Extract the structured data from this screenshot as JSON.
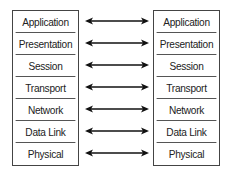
{
  "diagram": {
    "left_stack": {
      "layers": [
        "Application",
        "Presentation",
        "Session",
        "Transport",
        "Network",
        "Data Link",
        "Physical"
      ]
    },
    "right_stack": {
      "layers": [
        "Application",
        "Presentation",
        "Session",
        "Transport",
        "Network",
        "Data Link",
        "Physical"
      ]
    },
    "connectors": {
      "count": 7,
      "type": "bidirectional-arrow",
      "color": "#111111"
    },
    "colors": {
      "border": "#444444",
      "text": "#222222",
      "background": "#ffffff"
    }
  }
}
